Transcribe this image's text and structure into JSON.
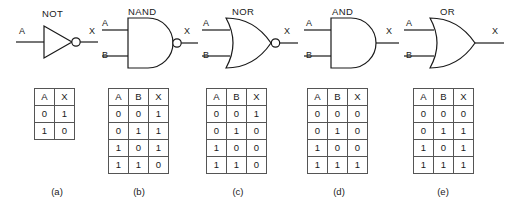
{
  "figure": {
    "background": "#ffffff",
    "line_color": "#1a1a1a",
    "table_border_color": "#555555"
  },
  "gates": [
    {
      "id": "not",
      "name": "NOT",
      "label": "NOT",
      "symbol": "triangle-with-bubble",
      "inputs": [
        "A"
      ],
      "output": "X",
      "caption": "(a)",
      "table": {
        "headers": [
          "A",
          "X"
        ],
        "rows": [
          [
            "0",
            "1"
          ],
          [
            "1",
            "0"
          ]
        ]
      }
    },
    {
      "id": "nand",
      "name": "NAND",
      "label": "NAND",
      "symbol": "d-shape-with-bubble",
      "inputs": [
        "A",
        "B"
      ],
      "output": "X",
      "caption": "(b)",
      "table": {
        "headers": [
          "A",
          "B",
          "X"
        ],
        "rows": [
          [
            "0",
            "0",
            "1"
          ],
          [
            "0",
            "1",
            "1"
          ],
          [
            "1",
            "0",
            "1"
          ],
          [
            "1",
            "1",
            "0"
          ]
        ]
      }
    },
    {
      "id": "nor",
      "name": "NOR",
      "label": "NOR",
      "symbol": "curved-shield-with-bubble",
      "inputs": [
        "A",
        "B"
      ],
      "output": "X",
      "caption": "(c)",
      "table": {
        "headers": [
          "A",
          "B",
          "X"
        ],
        "rows": [
          [
            "0",
            "0",
            "1"
          ],
          [
            "0",
            "1",
            "0"
          ],
          [
            "1",
            "0",
            "0"
          ],
          [
            "1",
            "1",
            "0"
          ]
        ]
      }
    },
    {
      "id": "and",
      "name": "AND",
      "label": "AND",
      "symbol": "d-shape",
      "inputs": [
        "A",
        "B"
      ],
      "output": "X",
      "caption": "(d)",
      "table": {
        "headers": [
          "A",
          "B",
          "X"
        ],
        "rows": [
          [
            "0",
            "0",
            "0"
          ],
          [
            "0",
            "1",
            "0"
          ],
          [
            "1",
            "0",
            "0"
          ],
          [
            "1",
            "1",
            "1"
          ]
        ]
      }
    },
    {
      "id": "or",
      "name": "OR",
      "label": "OR",
      "symbol": "curved-shield",
      "inputs": [
        "A",
        "B"
      ],
      "output": "X",
      "caption": "(e)",
      "table": {
        "headers": [
          "A",
          "B",
          "X"
        ],
        "rows": [
          [
            "0",
            "0",
            "0"
          ],
          [
            "0",
            "1",
            "1"
          ],
          [
            "1",
            "0",
            "1"
          ],
          [
            "1",
            "1",
            "1"
          ]
        ]
      }
    }
  ]
}
